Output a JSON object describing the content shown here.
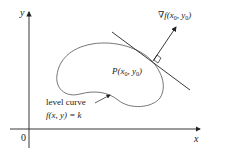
{
  "diagram": {
    "axes": {
      "x_label": "x",
      "y_label": "y",
      "origin_label": "0"
    },
    "point_label": {
      "prefix": "P",
      "args": [
        "x",
        "0",
        "y",
        "0"
      ]
    },
    "gradient_label": {
      "prefix": "∇f",
      "args": [
        "x",
        "0",
        "y",
        "0"
      ]
    },
    "curve_label": {
      "line1": "level curve",
      "line2": "f(x, y) = k"
    },
    "colors": {
      "ink": "#222222",
      "curve": "#666666",
      "background": "#ffffff"
    }
  }
}
